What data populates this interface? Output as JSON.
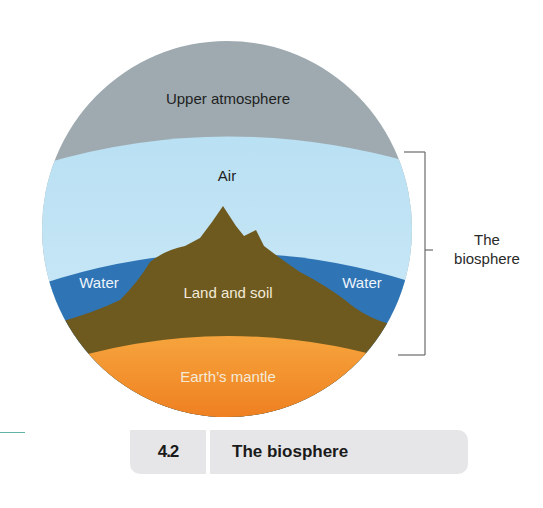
{
  "diagram": {
    "layers": [
      {
        "id": "upper-atmosphere",
        "label": "Upper atmosphere",
        "color": "#9eaab0"
      },
      {
        "id": "air",
        "label": "Air",
        "color": "#bfe3f4"
      },
      {
        "id": "water-left",
        "label": "Water",
        "color": "#2f74b5"
      },
      {
        "id": "land-and-soil",
        "label": "Land and soil",
        "color": "#6e5a1f"
      },
      {
        "id": "water-right",
        "label": "Water",
        "color": "#2f74b5"
      },
      {
        "id": "earths-mantle",
        "label": "Earth’s mantle",
        "color": "#f08a25"
      }
    ],
    "labels": {
      "upper_atmosphere": "Upper atmosphere",
      "air": "Air",
      "water_left": "Water",
      "land_and_soil": "Land and soil",
      "water_right": "Water",
      "earths_mantle": "Earth’s mantle"
    },
    "bracket_label": {
      "line1": "The",
      "line2": "biosphere"
    }
  },
  "caption": {
    "number": "4.2",
    "title": "The biosphere"
  },
  "colors": {
    "caption_bg": "#e6e6e8",
    "accent_rule": "#5fb3a8"
  }
}
